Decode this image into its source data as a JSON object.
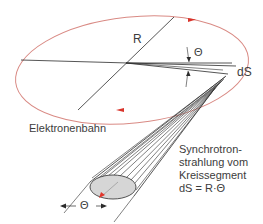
{
  "diagram": {
    "labels": {
      "radius": "R",
      "angle_top": "Θ",
      "segment": "dS",
      "orbit": "Elektronenbahn",
      "caption": [
        "Synchrotron-",
        "strahlung vom",
        "Kreissegment",
        "dS = R·Θ"
      ],
      "cone_angle": "Θ"
    },
    "colors": {
      "orbit": "#d98a84",
      "orbit_arrow": "#d9342b",
      "lines": "#2b2b2b",
      "cone_fill": "#d6d6d6",
      "beam_arrow": "#e0362c",
      "text": "#3c3c3c"
    },
    "elements": {
      "orbit_ellipse": {
        "cx": 132,
        "cy": 70,
        "rx": 117,
        "ry": 55,
        "rotation_deg": -6
      },
      "direction_arrows": 2,
      "beam_cone": {
        "end_ellipse_cx": 113,
        "end_ellipse_cy": 187,
        "rx": 23,
        "ry": 13
      }
    }
  }
}
